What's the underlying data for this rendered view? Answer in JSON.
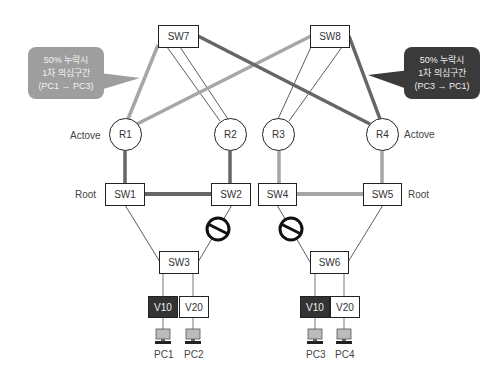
{
  "diagram": {
    "switches_top": [
      {
        "id": "sw7",
        "label": "SW7"
      },
      {
        "id": "sw8",
        "label": "SW8"
      }
    ],
    "routers": [
      {
        "id": "r1",
        "label": "R1",
        "role": "Actove"
      },
      {
        "id": "r2",
        "label": "R2"
      },
      {
        "id": "r3",
        "label": "R3"
      },
      {
        "id": "r4",
        "label": "R4",
        "role": "Actove"
      }
    ],
    "switches_mid": [
      {
        "id": "sw1",
        "label": "SW1",
        "role": "Root"
      },
      {
        "id": "sw2",
        "label": "SW2"
      },
      {
        "id": "sw4",
        "label": "SW4"
      },
      {
        "id": "sw5",
        "label": "SW5",
        "role": "Root"
      }
    ],
    "switches_access": [
      {
        "id": "sw3",
        "label": "SW3"
      },
      {
        "id": "sw6",
        "label": "SW6"
      }
    ],
    "vlans": [
      {
        "label": "V10",
        "style": "dark"
      },
      {
        "label": "V20",
        "style": "light"
      },
      {
        "label": "V10",
        "style": "dark"
      },
      {
        "label": "V20",
        "style": "light"
      }
    ],
    "pcs": [
      {
        "label": "PC1"
      },
      {
        "label": "PC2"
      },
      {
        "label": "PC3"
      },
      {
        "label": "PC4"
      }
    ],
    "callouts": [
      {
        "id": "left",
        "lines": [
          "50% 누락시",
          "1차 의심구간",
          "(PC1 → PC3)"
        ],
        "color": "#9e9e9e"
      },
      {
        "id": "right",
        "lines": [
          "50% 누락시",
          "1차 의심구간",
          "(PC3 → PC1)"
        ],
        "color": "#3a3a3a"
      }
    ],
    "blocked_icon": "blocked-port-icon",
    "pc_icon": "computer-icon",
    "colors": {
      "path_light": "#a6a6a6",
      "path_dark": "#666666",
      "thin_link": "#333333"
    }
  }
}
